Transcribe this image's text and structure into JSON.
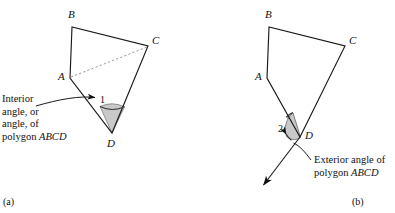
{
  "figure": {
    "width": 395,
    "height": 213,
    "background": "#ffffff",
    "stroke_color": "#1a1a1a",
    "shade_fill": "#c9c9c9",
    "dashed_color": "#8a8a8a"
  },
  "panel_a": {
    "label": "(a)",
    "vertices": [
      {
        "name": "A",
        "label": "A",
        "x": 70,
        "y": 78,
        "label_x": 59,
        "label_y": 70
      },
      {
        "name": "B",
        "label": "B",
        "x": 72,
        "y": 27,
        "label_x": 68,
        "label_y": 10
      },
      {
        "name": "C",
        "label": "C",
        "x": 148,
        "y": 46,
        "label_x": 152,
        "label_y": 36
      },
      {
        "name": "D",
        "label": "D",
        "x": 112,
        "y": 133,
        "label_x": 108,
        "label_y": 137
      }
    ],
    "diagonal": {
      "from": "A",
      "to": "C",
      "style": "dashed"
    },
    "angle_marker": {
      "at_vertex": "D",
      "number": "1",
      "number_x": 101,
      "number_y": 98,
      "shaded": true,
      "type": "interior-angle-sector"
    },
    "callout": {
      "lines": [
        {
          "text": "Interior",
          "italic_tail": ""
        },
        {
          "text": "angle, or",
          "italic_tail": ""
        },
        {
          "text": "angle, of",
          "italic_tail": ""
        },
        {
          "text": "polygon ",
          "italic_tail": "ABCD"
        }
      ],
      "x": 2,
      "y": 95
    }
  },
  "panel_b": {
    "label": "(b)",
    "vertices": [
      {
        "name": "A",
        "label": "A",
        "x": 267,
        "y": 78,
        "label_x": 256,
        "label_y": 70
      },
      {
        "name": "B",
        "label": "B",
        "x": 269,
        "y": 27,
        "label_x": 265,
        "label_y": 10
      },
      {
        "name": "C",
        "label": "C",
        "x": 345,
        "y": 46,
        "label_x": 349,
        "label_y": 36
      },
      {
        "name": "D",
        "label": "D",
        "x": 300,
        "y": 137,
        "label_x": 306,
        "label_y": 131
      }
    ],
    "extension_ray": {
      "from": "C",
      "through": "D",
      "arrow_x": 261,
      "arrow_y": 188
    },
    "angle_marker": {
      "at_vertex": "D",
      "number": "2",
      "number_x": 280,
      "number_y": 128,
      "shaded": true,
      "type": "exterior-angle-sector"
    },
    "callout": {
      "lines": [
        {
          "text": "Exterior angle of",
          "italic_tail": ""
        },
        {
          "text": "polygon ",
          "italic_tail": "ABCD"
        }
      ],
      "x": 314,
      "y": 155
    }
  }
}
